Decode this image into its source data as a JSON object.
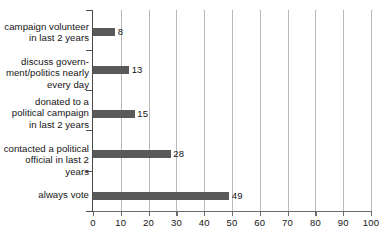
{
  "chart_data": {
    "type": "bar",
    "orientation": "horizontal",
    "title": "",
    "subtitle": "",
    "xlabel": "",
    "ylabel": "",
    "xlim": [
      0,
      100
    ],
    "ylim": null,
    "grid": "vertical",
    "legend": "none",
    "categories": [
      "campaign volunteer\nin last 2 years",
      "discuss govern-\nment/politics nearly\nevery day",
      "donated to a\npolitical campaign\nin last 2 years",
      "contacted a political\nofficial in last 2 years",
      "always vote"
    ],
    "values": [
      8,
      13,
      15,
      28,
      49
    ],
    "data_labels": [
      "8",
      "13",
      "15",
      "28",
      "49"
    ],
    "xticks": [
      0,
      10,
      20,
      30,
      40,
      50,
      60,
      70,
      80,
      90,
      100
    ],
    "xtick_labels": [
      "0",
      "10",
      "20",
      "30",
      "40",
      "50",
      "60",
      "70",
      "80",
      "90",
      "100"
    ],
    "colors": {
      "bar": "#595959",
      "gridline": "#b9b9b9",
      "axis": "#4a4a4a",
      "text": "#141414",
      "background": "#ffffff"
    }
  }
}
